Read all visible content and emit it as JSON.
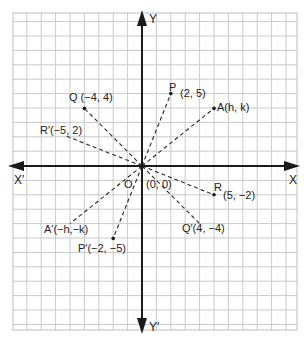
{
  "diagram": {
    "type": "coordinate-plane-reflection",
    "grid": {
      "unit_px": 14.4,
      "origin_px": [
        142,
        166
      ],
      "bounds_px": {
        "left": 13,
        "top": 13,
        "right": 297,
        "bottom": 330
      },
      "line_color": "#c8c8c8",
      "border_color": "#bdbdbd"
    },
    "axes": {
      "x_positive_label": "X",
      "x_negative_label": "X′",
      "y_positive_label": "Y",
      "y_negative_label": "Y′",
      "color": "#1a1a1a"
    },
    "origin": {
      "name": "O",
      "label": "O",
      "coord_label": "(0, 0)"
    },
    "points": [
      {
        "id": "P",
        "name": "P",
        "label": "P",
        "coord_label": "(2, 5)",
        "x": 2,
        "y": 5
      },
      {
        "id": "Pp",
        "name": "P′",
        "label": "P′(−2, −5)",
        "coord_label": "",
        "x": -2,
        "y": -5
      },
      {
        "id": "Q",
        "name": "Q",
        "label": "Q (−4, 4)",
        "coord_label": "",
        "x": -4,
        "y": 4
      },
      {
        "id": "Qp",
        "name": "Q′",
        "label": "Q′(4, −4)",
        "coord_label": "",
        "x": 4,
        "y": -4
      },
      {
        "id": "R",
        "name": "R",
        "label": "R",
        "coord_label": "(5, −2)",
        "x": 5,
        "y": -2
      },
      {
        "id": "Rp",
        "name": "R′",
        "label": "R′(−5, 2)",
        "coord_label": "",
        "x": -5,
        "y": 2
      },
      {
        "id": "A",
        "name": "A",
        "label": "A(h, k)",
        "coord_label": "",
        "x": 5,
        "y": 4
      },
      {
        "id": "Ap",
        "name": "A′",
        "label": "A′(−h,−k)",
        "coord_label": "",
        "x": -5,
        "y": -4
      }
    ],
    "segments_note": "Dashed segments join each point to the origin O(0, 0), showing reflection through the origin."
  }
}
